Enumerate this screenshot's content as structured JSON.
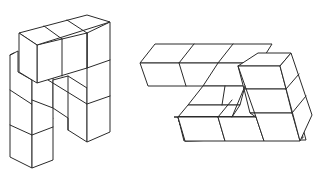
{
  "figure": {
    "background": "#ffffff",
    "line_color": "#2a2a2a",
    "figures": [
      {
        "name": "left-block-structure",
        "shape": "arch of stacked unit cubes"
      },
      {
        "name": "right-block-structure",
        "shape": "stepped staircase of unit cubes"
      }
    ]
  }
}
